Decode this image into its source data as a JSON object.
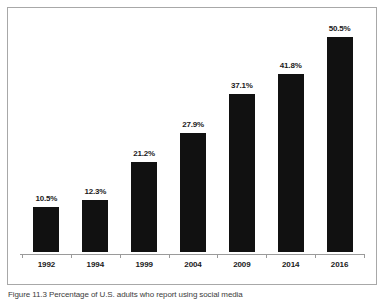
{
  "figure": {
    "background_color": "#ffffff",
    "frame_color": "#a8a8a8",
    "caption": "Figure 11.3  Percentage of U.S. adults who report using social media"
  },
  "chart_data": {
    "type": "bar",
    "title": "",
    "subtitle": "",
    "xlabel": "",
    "ylabel": "",
    "categories": [
      "1992",
      "1994",
      "1999",
      "2004",
      "2009",
      "2014",
      "2016"
    ],
    "values": [
      10.5,
      12.3,
      21.2,
      27.9,
      37.1,
      41.8,
      50.5
    ],
    "value_labels": [
      "10.5%",
      "12.3%",
      "21.2%",
      "27.9%",
      "37.1%",
      "41.8%",
      "50.5%"
    ],
    "ylim": [
      0,
      50.5
    ],
    "grid": false,
    "legend": null,
    "bar_color": "#111111",
    "axis_color": "#9a9a9a",
    "label_color": "#1a1a1a"
  }
}
